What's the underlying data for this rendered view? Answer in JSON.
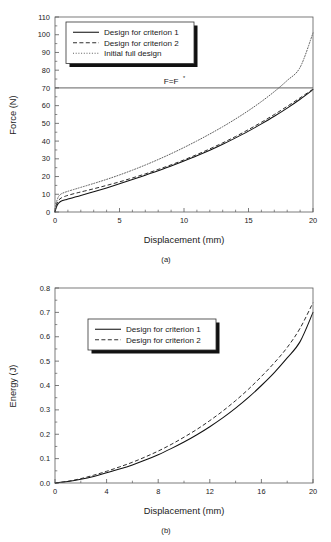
{
  "figure": {
    "panels": [
      {
        "id": "a",
        "subcaption": "(a)",
        "xlabel": "Displacement (mm)",
        "ylabel": "Force (N)"
      },
      {
        "id": "b",
        "subcaption": "(b)",
        "xlabel": "Displacement (mm)",
        "ylabel": "Energy (J)"
      }
    ]
  },
  "chart_data": [
    {
      "type": "line",
      "panel": "(a)",
      "title": "",
      "xlabel": "Displacement (mm)",
      "ylabel": "Force (N)",
      "xlim": [
        0,
        20
      ],
      "ylim": [
        0,
        110
      ],
      "xticks": [
        0,
        5,
        10,
        15,
        20
      ],
      "xticklabels": [
        "0",
        "5",
        "10",
        "15",
        "20"
      ],
      "xminor_step": 1,
      "yticks": [
        0,
        10,
        20,
        30,
        40,
        50,
        60,
        70,
        80,
        90,
        100,
        110
      ],
      "yticklabels": [
        "0",
        "10",
        "20",
        "30",
        "40",
        "50",
        "60",
        "70",
        "80",
        "90",
        "100",
        "110"
      ],
      "yminor_step": 5,
      "grid": false,
      "legend_position": "upper-left",
      "legend": [
        {
          "label": "Design for criterion 1",
          "style": "solid"
        },
        {
          "label": "Design for criterion 2",
          "style": "dashed"
        },
        {
          "label": "Initial full design",
          "style": "dotted"
        }
      ],
      "annotations": [
        {
          "text": "F=F",
          "superscript": "*",
          "type": "hline",
          "y": 70,
          "label_x": 9.0
        }
      ],
      "x": [
        0,
        0.1,
        0.2,
        0.3,
        0.5,
        0.8,
        1,
        1.5,
        2,
        3,
        4,
        5,
        6,
        7,
        8,
        9,
        10,
        11,
        12,
        13,
        14,
        15,
        16,
        17,
        18,
        19,
        20
      ],
      "series": [
        {
          "name": "Design for criterion 1",
          "style": "solid",
          "values": [
            0,
            2.6,
            4.2,
            5.2,
            6.2,
            6.9,
            7.3,
            8.3,
            9.3,
            11.4,
            13.6,
            15.9,
            18.3,
            20.8,
            23.3,
            26.0,
            28.8,
            31.7,
            34.8,
            38.2,
            41.8,
            45.6,
            49.7,
            54.0,
            58.6,
            63.6,
            69.0
          ]
        },
        {
          "name": "Design for criterion 2",
          "style": "dashed",
          "values": [
            0,
            3.6,
            5.6,
            6.8,
            8.0,
            8.9,
            9.4,
            10.4,
            11.3,
            13.1,
            15.0,
            17.0,
            19.2,
            21.5,
            24.0,
            26.6,
            29.4,
            32.4,
            35.6,
            39.0,
            42.6,
            46.5,
            50.6,
            55.0,
            59.6,
            64.4,
            69.3
          ]
        },
        {
          "name": "Initial full design",
          "style": "dotted",
          "values": [
            0,
            5.0,
            7.5,
            9.0,
            10.3,
            11.2,
            11.7,
            12.8,
            13.9,
            16.1,
            18.4,
            20.9,
            23.6,
            26.5,
            29.6,
            32.9,
            36.4,
            40.1,
            44.0,
            48.1,
            52.5,
            57.2,
            62.3,
            67.9,
            74.2,
            81.6,
            101.0
          ]
        }
      ]
    },
    {
      "type": "line",
      "panel": "(b)",
      "title": "",
      "xlabel": "Displacement (mm)",
      "ylabel": "Energy (J)",
      "xlim": [
        0,
        20
      ],
      "ylim": [
        0,
        0.8
      ],
      "xticks": [
        0,
        4,
        8,
        12,
        16,
        20
      ],
      "xticklabels": [
        "0",
        "4",
        "8",
        "12",
        "16",
        "20"
      ],
      "xminor_step": 2,
      "yticks": [
        0.0,
        0.1,
        0.2,
        0.3,
        0.4,
        0.5,
        0.6,
        0.7,
        0.8
      ],
      "yticklabels": [
        "0.0",
        "0.1",
        "0.2",
        "0.3",
        "0.4",
        "0.5",
        "0.6",
        "0.7",
        "0.8"
      ],
      "yminor_step": 0.05,
      "grid": false,
      "legend_position": "upper-center-left",
      "legend": [
        {
          "label": "Design for criterion 1",
          "style": "solid"
        },
        {
          "label": "Design for criterion 2",
          "style": "dashed"
        }
      ],
      "x": [
        0,
        1,
        2,
        3,
        4,
        5,
        6,
        7,
        8,
        9,
        10,
        11,
        12,
        13,
        14,
        15,
        16,
        17,
        18,
        19,
        20
      ],
      "series": [
        {
          "name": "Design for criterion 1",
          "style": "solid",
          "values": [
            0.0,
            0.006,
            0.015,
            0.027,
            0.042,
            0.057,
            0.074,
            0.094,
            0.116,
            0.141,
            0.168,
            0.198,
            0.231,
            0.267,
            0.307,
            0.351,
            0.4,
            0.453,
            0.513,
            0.58,
            0.7
          ]
        },
        {
          "name": "Design for criterion 2",
          "style": "dashed",
          "values": [
            0.0,
            0.007,
            0.018,
            0.032,
            0.048,
            0.066,
            0.085,
            0.107,
            0.131,
            0.158,
            0.188,
            0.22,
            0.256,
            0.295,
            0.338,
            0.385,
            0.437,
            0.493,
            0.556,
            0.635,
            0.74
          ]
        }
      ]
    }
  ]
}
